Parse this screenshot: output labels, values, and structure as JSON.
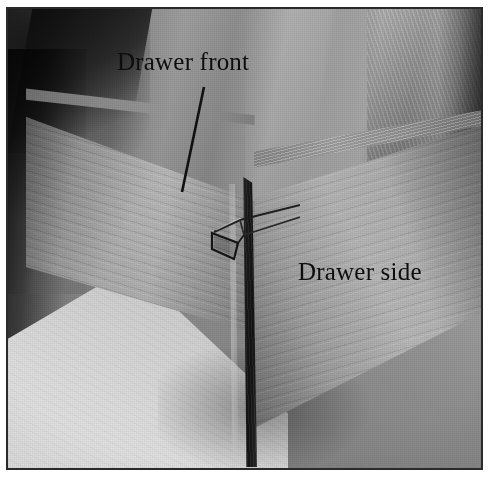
{
  "figure": {
    "kind": "photograph",
    "rendering": "grayscale / black-and-white halftone print",
    "frame": {
      "border_color": "#2a2a2a",
      "matte_color": "#ffffff"
    }
  },
  "labels": [
    {
      "id": "drawer-front",
      "text": "Drawer front",
      "color": "#0d0d0d",
      "has_leader_line": true,
      "leader_line": {
        "from": [
          196,
          78
        ],
        "to": [
          174,
          182
        ],
        "color": "#111111"
      }
    },
    {
      "id": "drawer-side",
      "text": "Drawer side",
      "color": "#0d0d0d",
      "has_leader_line": false
    }
  ],
  "scene": {
    "background": "draped gray cloth backdrop with vertical folds",
    "foreground_surface": "light workbench top",
    "parts": [
      {
        "name": "drawer-front-board",
        "position": "left",
        "tone": "#a4a4a4"
      },
      {
        "name": "drawer-side-board",
        "position": "right",
        "tone": "#a8a8a8"
      },
      {
        "name": "corner-end-grain-edge",
        "position": "center",
        "tone": "#1e1e1e"
      },
      {
        "name": "rabbet-joint-detail",
        "position": "center-upper",
        "tone": "#2b2b2b"
      }
    ]
  },
  "palette": {
    "highlight": "#e8e8e8",
    "midtone": "#9a9a9a",
    "shadow": "#1e1e1e",
    "ink": "#0d0d0d",
    "paper": "#ffffff"
  }
}
